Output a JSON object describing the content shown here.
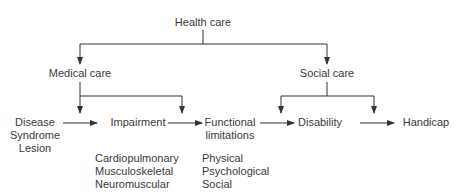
{
  "diagram": {
    "type": "flow-hierarchy",
    "colors": {
      "line": "#333333",
      "text": "#3a3a3a",
      "background": "#ffffff"
    },
    "nodes": {
      "health_care": "Health care",
      "medical_care": "Medical care",
      "social_care": "Social care",
      "disease": [
        "Disease",
        "Syndrome",
        "Lesion"
      ],
      "impairment": "Impairment",
      "functional_limitations": [
        "Functional",
        "limitations"
      ],
      "disability": "Disability",
      "handicap": "Handicap"
    },
    "sublists": {
      "impairment_types": [
        "Cardiopulmonary",
        "Musculoskeletal",
        "Neuromuscular"
      ],
      "functional_types": [
        "Physical",
        "Psychological",
        "Social"
      ]
    },
    "edges": [
      {
        "from": "Health care",
        "to": "Medical care"
      },
      {
        "from": "Health care",
        "to": "Social care"
      },
      {
        "from": "Medical care",
        "to": "Impairment"
      },
      {
        "from": "Medical care",
        "to": "Functional limitations"
      },
      {
        "from": "Social care",
        "to": "Disability"
      },
      {
        "from": "Social care",
        "to": "Handicap"
      },
      {
        "from": "Disease/Syndrome/Lesion",
        "to": "Impairment"
      },
      {
        "from": "Impairment",
        "to": "Functional limitations"
      },
      {
        "from": "Functional limitations",
        "to": "Disability"
      },
      {
        "from": "Disability",
        "to": "Handicap"
      }
    ]
  }
}
